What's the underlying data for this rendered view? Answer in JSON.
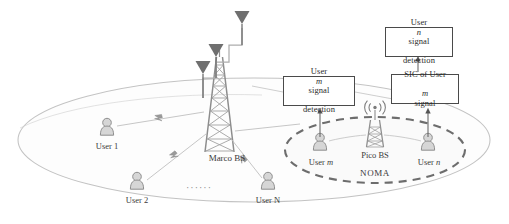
{
  "figure": {
    "type": "network-topology-diagram",
    "background": "#ffffff",
    "ink": "#4a4a4a",
    "faint_ink": "#b9b9b9"
  },
  "macro_cell": {
    "base_station_label": "Marco BS",
    "antenna_count": 3,
    "users": [
      {
        "label": "User 1"
      },
      {
        "label": "User 2"
      },
      {
        "label": "User N"
      }
    ],
    "ellipsis": "······"
  },
  "pico_cell": {
    "base_station_label": "Pico BS",
    "region_label": "NOMA",
    "users": [
      {
        "label_prefix": "User ",
        "label_italic": "m"
      },
      {
        "label_prefix": "User ",
        "label_italic": "n"
      }
    ]
  },
  "process_boxes": [
    {
      "name": "user-m-detection",
      "line1_prefix": "User ",
      "line1_italic": "m",
      "line1_suffix": " signal",
      "line2": "detection"
    },
    {
      "name": "sic-user-m",
      "line1": "SIC of User",
      "line2_italic": "m",
      "line2_suffix": " signal"
    },
    {
      "name": "user-n-detection",
      "line1_prefix": "User ",
      "line1_italic": "n",
      "line1_suffix": " signal",
      "line2": "detection"
    }
  ]
}
